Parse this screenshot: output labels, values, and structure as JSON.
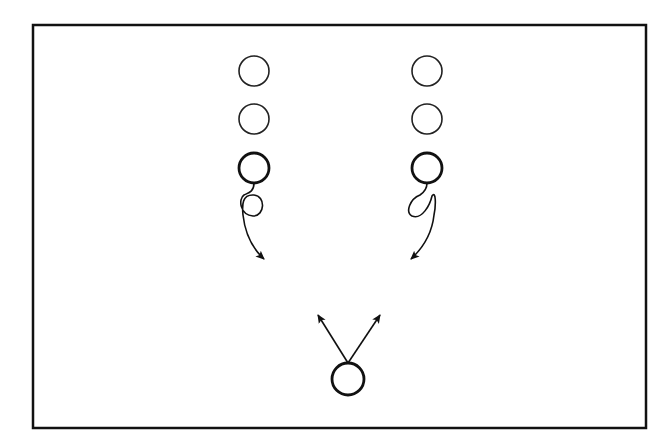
{
  "diagram": {
    "type": "drill-formation",
    "frame": {
      "x": 33,
      "y": 25,
      "width": 613,
      "height": 403,
      "stroke": "#111111"
    },
    "colors": {
      "stroke": "#111111",
      "background": "#ffffff"
    },
    "columns": [
      {
        "name": "left-column",
        "players": [
          {
            "cx": 254,
            "cy": 71,
            "r": 15,
            "emphasis": "normal"
          },
          {
            "cx": 254,
            "cy": 119,
            "r": 15,
            "emphasis": "normal"
          },
          {
            "cx": 254,
            "cy": 168,
            "r": 15,
            "emphasis": "bold"
          }
        ],
        "path": {
          "type": "loop-then-curve-arrow",
          "direction": "down-right",
          "tip": {
            "x": 264,
            "y": 260
          }
        }
      },
      {
        "name": "right-column",
        "players": [
          {
            "cx": 427,
            "cy": 71,
            "r": 15,
            "emphasis": "normal"
          },
          {
            "cx": 427,
            "cy": 119,
            "r": 15,
            "emphasis": "normal"
          },
          {
            "cx": 427,
            "cy": 168,
            "r": 15,
            "emphasis": "bold"
          }
        ],
        "path": {
          "type": "loop-then-curve-arrow",
          "direction": "down-left",
          "tip": {
            "x": 411,
            "y": 259
          }
        }
      }
    ],
    "bottom_player": {
      "cx": 348,
      "cy": 379,
      "r": 16,
      "emphasis": "bold",
      "arrows": [
        {
          "name": "arrow-up-left",
          "from": {
            "x": 348,
            "y": 363
          },
          "to": {
            "x": 317,
            "y": 313
          }
        },
        {
          "name": "arrow-up-right",
          "from": {
            "x": 348,
            "y": 363
          },
          "to": {
            "x": 381,
            "y": 313
          }
        }
      ]
    }
  }
}
